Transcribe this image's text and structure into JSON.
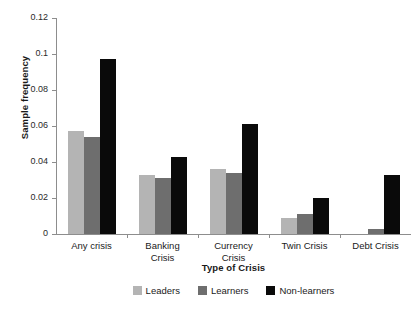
{
  "chart_data": {
    "type": "bar",
    "title": "",
    "xlabel": "Type of Crisis",
    "ylabel": "Sample frequency",
    "categories": [
      "Any crisis",
      "Banking\nCrisis",
      "Currency\nCrisis",
      "Twin Crisis",
      "Debt Crisis"
    ],
    "ylim": [
      0,
      0.12
    ],
    "ytick_labels": [
      "0",
      "0.02",
      "0.04",
      "0.06",
      "0.08",
      "0.1",
      "0.12"
    ],
    "ytick_values": [
      0,
      0.02,
      0.04,
      0.06,
      0.08,
      0.1,
      0.12
    ],
    "grid": false,
    "legend_position": "bottom-center",
    "series": [
      {
        "name": "Leaders",
        "color": "#b4b4b4",
        "values": [
          0.057,
          0.033,
          0.036,
          0.009,
          0.0
        ]
      },
      {
        "name": "Learners",
        "color": "#6e6e6e",
        "values": [
          0.054,
          0.031,
          0.034,
          0.011,
          0.003
        ]
      },
      {
        "name": "Non-learners",
        "color": "#0a0a0a",
        "values": [
          0.097,
          0.043,
          0.061,
          0.02,
          0.033
        ]
      }
    ]
  }
}
